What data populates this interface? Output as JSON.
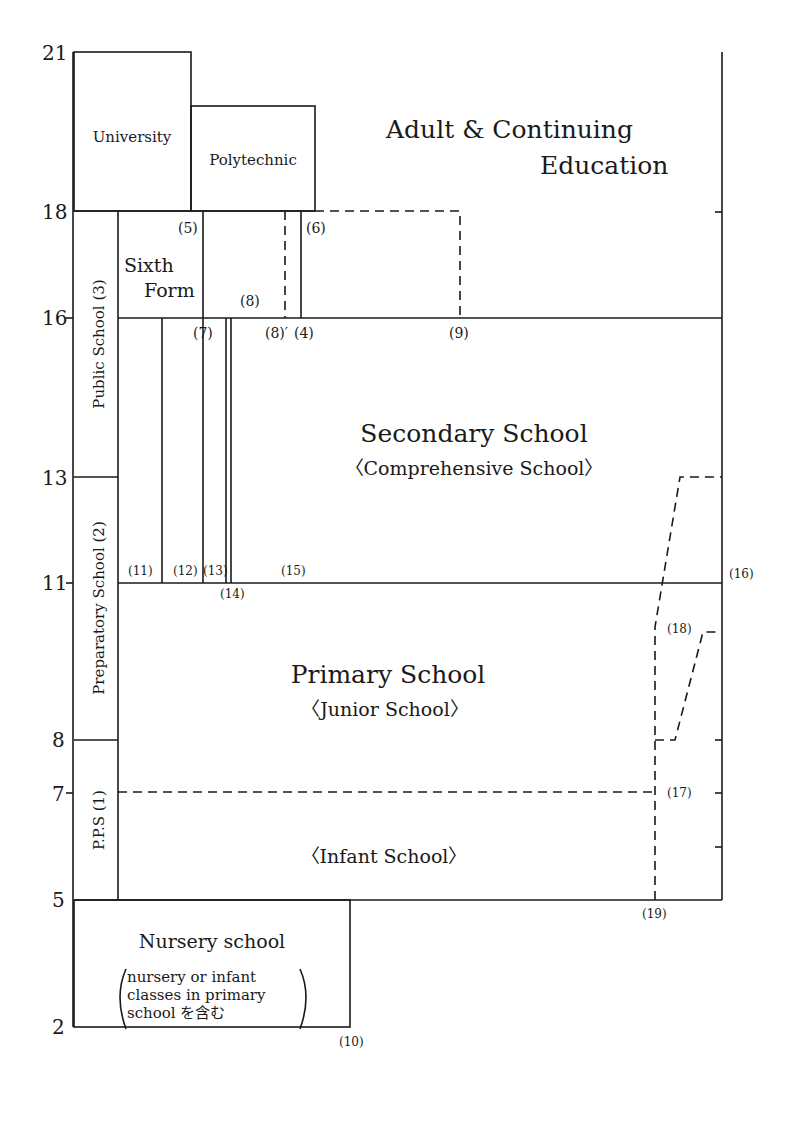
{
  "diagram": {
    "title": "",
    "age_axis": {
      "ticks": [
        "21",
        "18",
        "16",
        "13",
        "11",
        "8",
        "7",
        "5",
        "2"
      ]
    },
    "blocks": {
      "university": "University",
      "polytechnic": "Polytechnic",
      "adult_line1": "Adult & Continuing",
      "adult_line2": "Education",
      "sixth_form_line1": "Sixth",
      "sixth_form_line2": "Form",
      "public_school": "Public School (3)",
      "preparatory_school": "Preparatory School (2)",
      "pps": "P.P.S (1)",
      "secondary_title": "Secondary School",
      "secondary_sub": "〈Comprehensive School〉",
      "primary_title": "Primary School",
      "primary_sub": "〈Junior School〉",
      "infant_sub": "〈Infant School〉",
      "nursery_title": "Nursery school",
      "nursery_line1": "nursery or infant",
      "nursery_line2": "classes in primary",
      "nursery_line3": "school を含む"
    },
    "notes": {
      "n4": "(4)",
      "n5": "(5)",
      "n6": "(6)",
      "n7": "(7)",
      "n8": "(8)",
      "n8p": "(8)′",
      "n9": "(9)",
      "n10": "(10)",
      "n11": "(11)",
      "n12": "(12)",
      "n13": "(13)",
      "n14": "(14)",
      "n15": "(15)",
      "n16": "(16)",
      "n17": "(17)",
      "n18": "(18)",
      "n19": "(19)"
    }
  }
}
